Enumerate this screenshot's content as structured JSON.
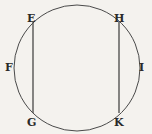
{
  "diagram": {
    "type": "geometry",
    "circle": {
      "cx": 77,
      "cy": 68,
      "r": 63
    },
    "chords": [
      {
        "from": "E",
        "to": "G",
        "x": 33,
        "y1": 22,
        "y2": 113
      },
      {
        "from": "H",
        "to": "K",
        "x": 119,
        "y1": 22,
        "y2": 113
      }
    ],
    "labels": {
      "E": "E",
      "F": "F",
      "G": "G",
      "H": "H",
      "I": "I",
      "K": "K"
    },
    "colors": {
      "stroke": "#3a3a3a",
      "background": "#f4f2ee"
    }
  }
}
